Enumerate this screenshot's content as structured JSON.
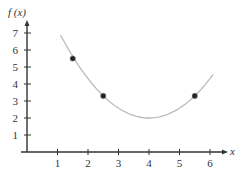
{
  "chart_data": {
    "type": "line",
    "title": "",
    "xlabel": "x",
    "ylabel": "f (x)",
    "xlim": [
      0,
      6.5
    ],
    "ylim": [
      0,
      7.5
    ],
    "x_ticks": [
      1,
      2,
      3,
      4,
      5,
      6
    ],
    "y_ticks": [
      1,
      2,
      3,
      4,
      5,
      6,
      7
    ],
    "grid": false,
    "legend": null,
    "curve": {
      "description": "parabola with minimum near (4, 2)",
      "x_range": [
        1.1,
        6.1
      ],
      "vertex": [
        4,
        2
      ],
      "a": 0.58,
      "color": "#bbbbbb"
    },
    "points": [
      {
        "x": 1.5,
        "y": 5.5
      },
      {
        "x": 2.5,
        "y": 3.3
      },
      {
        "x": 5.5,
        "y": 3.3
      }
    ]
  },
  "labels": {
    "x_axis": "x",
    "y_axis": "f (x)",
    "x_ticks": [
      "1",
      "2",
      "3",
      "4",
      "5",
      "6"
    ],
    "y_ticks": [
      "1",
      "2",
      "3",
      "4",
      "5",
      "6",
      "7"
    ]
  }
}
